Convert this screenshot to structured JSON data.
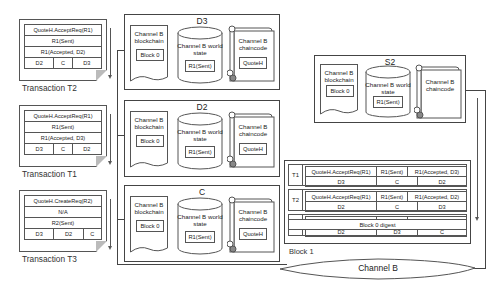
{
  "transactions": [
    {
      "label": "Transaction T2",
      "proposal": "QuoteH.AcceptReq(R1)",
      "read_set": "R1(Sent)",
      "write_set": "R1(Accepted, D2)",
      "endorsers": [
        "D2",
        "C",
        "D3"
      ]
    },
    {
      "label": "Transaction T1",
      "proposal": "QuoteH.AcceptReq(R1)",
      "read_set": "R1(Sent)",
      "write_set": "R1(Accepted, D3)",
      "endorsers": [
        "D3",
        "C",
        "D2"
      ]
    },
    {
      "label": "Transaction T3",
      "proposal": "QuoteH.CreateReq(R2)",
      "read_set": "N/A",
      "write_set": "R2(Sent)",
      "endorsers": [
        "D3",
        "D2",
        "C"
      ]
    }
  ],
  "peers": [
    {
      "name": "D3",
      "blockchain": {
        "title": "Channel B blockchain",
        "block": "Block 0"
      },
      "world_state": {
        "title": "Channel B world state",
        "value": "R1(Sent)"
      },
      "chaincode": {
        "title": "Channel B chaincode",
        "value": "QuoteH"
      }
    },
    {
      "name": "D2",
      "blockchain": {
        "title": "Channel B blockchain",
        "block": "Block 0"
      },
      "world_state": {
        "title": "Channel B world state",
        "value": "R1(Sent)"
      },
      "chaincode": {
        "title": "Channel B chaincode",
        "value": "QuoteH"
      }
    },
    {
      "name": "C",
      "blockchain": {
        "title": "Channel B blockchain",
        "block": "Block 0"
      },
      "world_state": {
        "title": "Channel B world state",
        "value": "R1(Sent)"
      },
      "chaincode": {
        "title": "Channel B chaincode",
        "value": "QuoteH"
      }
    }
  ],
  "orderer": {
    "name": "S2",
    "blockchain": {
      "title": "Channel B blockchain",
      "block": "Block 0"
    },
    "world_state": {
      "title": "Channel B world state",
      "value": "R1(Sent)"
    },
    "chaincode": {
      "title": "Channel B chaincode"
    }
  },
  "block1": {
    "label": "Block 1",
    "transactions": [
      {
        "id": "T1",
        "proposal": "QuoteH.AcceptReq(R1)",
        "read_set": "R1(Sent)",
        "write_set": "R1(Accepted, D3)",
        "endorsers": [
          "D3",
          "C",
          "D2"
        ]
      },
      {
        "id": "T2",
        "proposal": "QuoteH.AcceptReq(R1)",
        "read_set": "R1(Sent)",
        "write_set": "R1(Accepted, D2)",
        "endorsers": [
          "D2",
          "C",
          "D3"
        ]
      },
      {
        "id": "T3",
        "proposal": "QuoteH.CreateReq(R2)",
        "read_set": "N/A",
        "write_set": "R2(Sent)",
        "endorsers": [
          "D2",
          "D3",
          "C"
        ]
      }
    ],
    "digest": "Block 0 digest"
  },
  "channel": {
    "label": "Channel B"
  }
}
